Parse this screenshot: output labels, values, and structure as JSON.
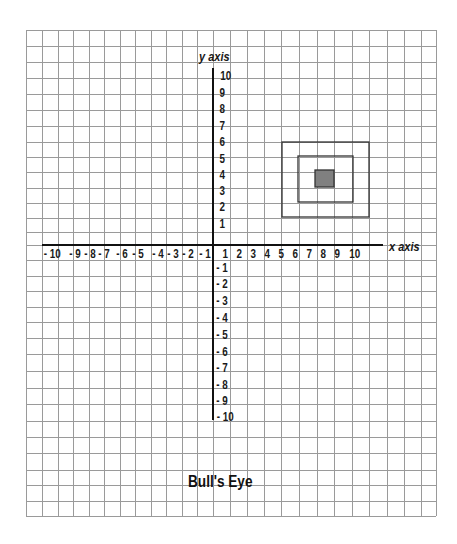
{
  "worksheet": {
    "title": "Bull's Eye",
    "x_axis_label": "x axis",
    "y_axis_label": "y axis"
  },
  "chart_data": {
    "type": "coordinate-grid",
    "title": "Bull's Eye",
    "xlabel": "x axis",
    "ylabel": "y axis",
    "xlim": [
      -10,
      10
    ],
    "ylim": [
      -10,
      10
    ],
    "grid": true,
    "x_ticks": [
      "-10",
      "-9",
      "-8",
      "-7",
      "-6",
      "-5",
      "-4",
      "-3",
      "-2",
      "-1",
      "1",
      "2",
      "3",
      "4",
      "5",
      "6",
      "7",
      "8",
      "9",
      "10"
    ],
    "y_ticks": [
      "10",
      "9",
      "8",
      "7",
      "6",
      "5",
      "4",
      "3",
      "2",
      "1",
      "-1",
      "-2",
      "-3",
      "-4",
      "-5",
      "-6",
      "-7",
      "-8",
      "-9",
      "-10"
    ],
    "shapes": [
      {
        "name": "outer-square",
        "type": "square-outline",
        "x_range": [
          4,
          9
        ],
        "y_range": [
          1,
          6
        ]
      },
      {
        "name": "middle-square",
        "type": "square-outline",
        "x_range": [
          5,
          8
        ],
        "y_range": [
          2,
          5
        ]
      },
      {
        "name": "bullseye-center",
        "type": "filled-square",
        "x_range": [
          6,
          7
        ],
        "y_range": [
          3,
          4
        ],
        "fill": "#808080"
      }
    ]
  },
  "colors": {
    "grid": "#9a9a9a",
    "axis": "#111111",
    "shape_stroke": "#333333",
    "bullseye_fill": "#808080"
  }
}
